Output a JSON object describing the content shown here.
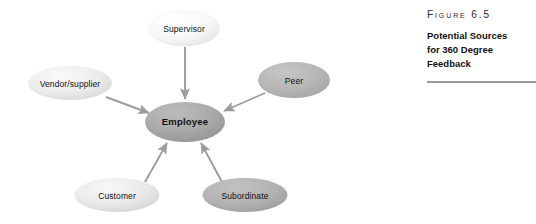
{
  "figure": {
    "number_label": "FIGURE 6.5",
    "title_lines": [
      "Potential Sources",
      "for 360 Degree",
      "Feedback"
    ],
    "rule_color": "#9a9a9a"
  },
  "diagram": {
    "type": "hub-and-spoke",
    "center": {
      "id": "employee",
      "label": "Employee",
      "cx": 185,
      "cy": 122,
      "rx": 40,
      "ry": 20,
      "fill": "#a8a8a8",
      "bold": true
    },
    "nodes": [
      {
        "id": "supervisor",
        "label": "Supervisor",
        "cx": 184,
        "cy": 28,
        "rx": 36,
        "ry": 18.5,
        "fill": "#f4f4f4"
      },
      {
        "id": "vendor-supplier",
        "label": "Vendor/supplier",
        "cx": 70,
        "cy": 83,
        "rx": 42,
        "ry": 17,
        "fill": "#e8e8e8"
      },
      {
        "id": "peer",
        "label": "Peer",
        "cx": 294,
        "cy": 80,
        "rx": 36,
        "ry": 18,
        "fill": "#b4b4b4"
      },
      {
        "id": "customer",
        "label": "Customer",
        "cx": 117,
        "cy": 195,
        "rx": 42.5,
        "ry": 17,
        "fill": "#e4e4e4"
      },
      {
        "id": "subordinate",
        "label": "Subordinate",
        "cx": 245,
        "cy": 195,
        "rx": 42.5,
        "ry": 17,
        "fill": "#b0b0b0"
      }
    ],
    "arrows": [
      {
        "id": "supervisor-to-employee",
        "from": "supervisor",
        "to": "employee",
        "direction": "inward"
      },
      {
        "id": "vendor-to-employee",
        "from": "vendor-supplier",
        "to": "employee",
        "direction": "inward"
      },
      {
        "id": "peer-to-employee",
        "from": "peer",
        "to": "employee",
        "direction": "inward"
      },
      {
        "id": "customer-to-employee",
        "from": "customer",
        "to": "employee",
        "direction": "inward"
      },
      {
        "id": "subordinate-to-employee",
        "from": "subordinate",
        "to": "employee",
        "direction": "inward"
      }
    ],
    "arrow_color": "#9c9c9c",
    "background": "#ffffff"
  }
}
